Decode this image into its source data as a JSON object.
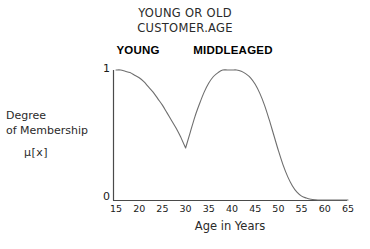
{
  "title": {
    "line1": "YOUNG OR OLD",
    "line2": "CUSTOMER.AGE"
  },
  "labels": {
    "young": "YOUNG",
    "middleaged": "MIDDLEAGED",
    "y_axis_line1": "Degree",
    "y_axis_line2": "of Membership",
    "y_axis_line3": "μ[x]",
    "x_axis": "Age in Years",
    "y_max": "1",
    "y_min": "0"
  },
  "colors": {
    "curve": "#6e6e6e",
    "axis": "#4a4a4a",
    "text": "#1a1a1a",
    "background": "#ffffff"
  },
  "chart_data": {
    "type": "line",
    "title": "YOUNG OR OLD CUSTOMER.AGE",
    "xlabel": "Age in Years",
    "ylabel": "Degree of Membership μ[x]",
    "xlim": [
      15,
      65
    ],
    "ylim": [
      0,
      1
    ],
    "grid": false,
    "legend": false,
    "xticks": [
      15,
      20,
      25,
      30,
      35,
      40,
      45,
      50,
      55,
      60,
      65
    ],
    "xticklabels": [
      "15",
      "20",
      "25",
      "30",
      "35",
      "40",
      "45",
      "50",
      "55",
      "60",
      "65"
    ],
    "yticks": [
      0,
      1
    ],
    "yticklabels": [
      "0",
      "1"
    ],
    "annotations": [
      {
        "text": "YOUNG",
        "x": 20,
        "y": 1.1
      },
      {
        "text": "MIDDLEAGED",
        "x": 40,
        "y": 1.1
      }
    ],
    "series": [
      {
        "name": "YOUNG OR MIDDLEAGED (max)",
        "x": [
          15,
          16,
          17,
          18,
          19,
          20,
          21,
          22,
          23,
          24,
          25,
          26,
          27,
          28,
          29,
          30,
          31,
          32,
          33,
          34,
          35,
          36,
          37,
          38,
          39,
          40,
          41,
          42,
          43,
          44,
          45,
          46,
          47,
          48,
          49,
          50,
          51,
          52,
          53,
          54,
          55,
          56,
          57,
          58,
          59,
          60,
          65
        ],
        "y": [
          1.0,
          1.0,
          0.99,
          0.98,
          0.96,
          0.94,
          0.91,
          0.87,
          0.83,
          0.78,
          0.73,
          0.67,
          0.61,
          0.55,
          0.48,
          0.4,
          0.52,
          0.64,
          0.74,
          0.83,
          0.9,
          0.95,
          0.98,
          1.0,
          1.0,
          1.0,
          1.0,
          0.99,
          0.97,
          0.94,
          0.89,
          0.82,
          0.73,
          0.62,
          0.5,
          0.38,
          0.27,
          0.18,
          0.11,
          0.06,
          0.03,
          0.015,
          0.006,
          0.002,
          0.0,
          0.0,
          0.0
        ]
      }
    ],
    "components": [
      {
        "name": "YOUNG",
        "description": "membership decreases from 1.0 at age 15 to 0.4 at age 30",
        "peak_x": 15,
        "peak_y": 1.0,
        "crossover_x": 30,
        "crossover_y": 0.4
      },
      {
        "name": "MIDDLEAGED",
        "description": "membership rises from 0.4 at age 30 to 1.0 near age 39-41, then falls to 0 by age 59",
        "peak_x": 40,
        "peak_y": 1.0,
        "left_foot_x": 30,
        "right_foot_x": 59
      }
    ]
  }
}
